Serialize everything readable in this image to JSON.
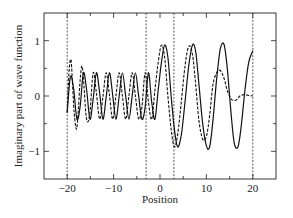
{
  "chart_data": {
    "type": "line",
    "title": "",
    "xlabel": "Position",
    "ylabel": "Imaginary part of wave function",
    "xlim": [
      -25,
      25
    ],
    "ylim": [
      -1.5,
      1.5
    ],
    "xticks": [
      -20,
      -10,
      0,
      10,
      20
    ],
    "xtick_labels": [
      "−20",
      "−10",
      "0",
      "10",
      "20"
    ],
    "xminor_ticks": [
      -15,
      -5,
      5,
      15
    ],
    "yticks": [
      -1,
      0,
      1
    ],
    "ytick_labels": [
      "−1",
      "0",
      "1"
    ],
    "yminor_ticks": [
      -0.5,
      0.5
    ],
    "grid": false,
    "legend": null,
    "vertical_dashed_lines": [
      -20,
      -3,
      3,
      20
    ],
    "series": [
      {
        "name": "solid",
        "style": "solid",
        "x": [
          -20,
          -19.3,
          -18.6,
          -17.9,
          -17.2,
          -16.5,
          -15.8,
          -15.1,
          -14.4,
          -13.7,
          -13.0,
          -12.3,
          -11.6,
          -10.9,
          -10.2,
          -9.5,
          -8.8,
          -8.1,
          -7.4,
          -6.7,
          -6.0,
          -5.3,
          -4.6,
          -3.9,
          -3.2,
          -2.5,
          -1.8,
          -1.1,
          -0.4,
          0.3,
          1.0,
          1.7,
          2.4,
          3.1,
          3.8,
          4.6,
          5.4,
          6.2,
          7.0,
          7.7,
          8.4,
          9.2,
          10.0,
          10.7,
          11.4,
          12.2,
          13.0,
          13.8,
          14.5,
          15.3,
          16.0,
          16.8,
          17.5,
          18.3,
          19.1,
          20.0
        ],
        "y": [
          -0.3,
          0.35,
          0.12,
          -0.42,
          -0.18,
          0.42,
          0.1,
          -0.42,
          -0.05,
          0.42,
          0.05,
          -0.42,
          -0.02,
          0.42,
          0.02,
          -0.42,
          0.0,
          0.42,
          0.0,
          -0.42,
          0.0,
          0.42,
          0.0,
          -0.42,
          -0.2,
          0.42,
          -0.1,
          -0.42,
          0.1,
          0.6,
          0.92,
          0.7,
          0.0,
          -0.6,
          -0.92,
          -0.7,
          -0.1,
          0.55,
          0.92,
          0.8,
          0.2,
          -0.5,
          -0.9,
          -0.92,
          -0.45,
          0.3,
          0.85,
          0.93,
          0.5,
          -0.3,
          -0.85,
          -0.92,
          -0.55,
          0.1,
          0.6,
          0.82
        ]
      },
      {
        "name": "dashed",
        "style": "dashed",
        "x": [
          -20,
          -19.6,
          -19.2,
          -18.9,
          -18.5,
          -18.0,
          -17.6,
          -17.2,
          -16.8,
          -16.4,
          -16.0,
          -15.6,
          -15.1,
          -14.4,
          -13.7,
          -13.0,
          -12.3,
          -11.6,
          -10.9,
          -10.2,
          -9.5,
          -8.8,
          -8.1,
          -7.4,
          -6.7,
          -6.0,
          -5.3,
          -4.6,
          -3.9,
          -3.2,
          -2.5,
          -1.8,
          -1.1,
          -0.4,
          0.3,
          1.0,
          1.7,
          2.4,
          3.1,
          3.8,
          4.6,
          5.4,
          6.2,
          7.0,
          7.7,
          8.4,
          9.2,
          10.0,
          10.7,
          11.4,
          12.2,
          13.0,
          13.8,
          14.5,
          15.3,
          16.0,
          16.6,
          17.2,
          17.8,
          18.5,
          19.2,
          20.0
        ],
        "y": [
          -0.3,
          0.45,
          0.66,
          0.3,
          -0.3,
          -0.6,
          -0.25,
          0.3,
          0.54,
          0.2,
          -0.3,
          -0.47,
          -0.3,
          0.42,
          0.05,
          -0.42,
          -0.02,
          0.42,
          0.02,
          -0.42,
          0.0,
          0.42,
          0.0,
          -0.42,
          0.0,
          0.42,
          0.0,
          -0.42,
          -0.2,
          0.42,
          -0.1,
          -0.42,
          0.1,
          0.6,
          0.92,
          0.7,
          0.0,
          -0.6,
          -0.92,
          -0.7,
          -0.1,
          0.55,
          0.9,
          0.75,
          0.2,
          -0.45,
          -0.78,
          -0.73,
          -0.35,
          0.2,
          0.42,
          0.46,
          0.32,
          0.1,
          -0.05,
          -0.08,
          -0.06,
          0.0,
          0.02,
          0.02,
          0.01,
          0.0
        ]
      }
    ]
  }
}
